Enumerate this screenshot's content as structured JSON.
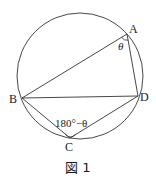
{
  "figure": {
    "caption": "図 1",
    "stroke_color": "#333333",
    "circle": {
      "cx": 80,
      "cy": 76,
      "r": 63
    },
    "points": {
      "A": {
        "label": "A",
        "x": 127,
        "y": 34
      },
      "B": {
        "label": "B",
        "x": 22,
        "y": 98
      },
      "C": {
        "label": "C",
        "x": 70,
        "y": 138
      },
      "D": {
        "label": "D",
        "x": 138,
        "y": 96
      }
    },
    "segments": [
      "AB",
      "AD",
      "BD",
      "BC",
      "CD"
    ],
    "angles": {
      "A": {
        "label": "θ"
      },
      "C": {
        "label": "180°−θ"
      }
    }
  }
}
